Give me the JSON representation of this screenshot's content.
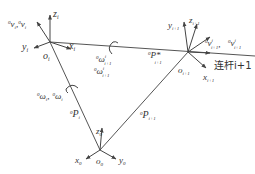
{
  "diagram": {
    "title": "",
    "frames": {
      "frame_i": {
        "origin": "o",
        "origin_sub": "i",
        "x": "x",
        "x_sub": "i",
        "y": "y",
        "y_sub": "i",
        "z": "z",
        "z_sub": "i"
      },
      "frame_i1": {
        "origin": "o",
        "origin_sub": "i+1",
        "x": "x",
        "x_sub": "i+1",
        "y": "y",
        "y_sub": "i+1",
        "z": "z",
        "z_sub": "i+1"
      },
      "frame_0": {
        "origin": "o",
        "origin_sub": "0",
        "x": "x",
        "x_sub": "0",
        "y": "y",
        "y_sub": "0",
        "z": "z",
        "z_sub": "0"
      }
    },
    "labels": {
      "v_i": "⁰vᵢ, ⁰v̇ᵢ",
      "v_i_pre": "0",
      "v_i_text": "v",
      "v_i_sub": "i",
      "omega_i_text": "ω",
      "omega_i_sub": "i",
      "omega_i1_text": "ω",
      "omega_i1_sub": "i+1",
      "p_star": "P*",
      "p_star_sub": "i+1",
      "p_i": "P",
      "p_i_sub": "i",
      "p_i1": "P",
      "p_i1_sub": "i+1",
      "v_i1_text": "v",
      "v_i1_sub": "i+1",
      "link_label": "连杆i+1",
      "zero": "0"
    }
  }
}
